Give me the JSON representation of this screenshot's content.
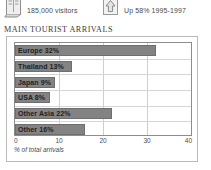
{
  "stats": [
    {
      "icon": "open-book-icon",
      "label": "185,000 visitors"
    },
    {
      "icon": "up-arrow-icon",
      "label": "Up 58% 1995-1997"
    }
  ],
  "title": "MAIN TOURIST ARRIVALS",
  "colors": {
    "bar_fill": "#838383",
    "bar_stroke": "#6e6e6e",
    "panel_border": "#b9b9b9",
    "plot_border": "#8c8c8c",
    "gridline": "#cfcfcf",
    "text": "#3a3a3a"
  },
  "chart_data": {
    "type": "bar",
    "orientation": "horizontal",
    "title": "MAIN TOURIST ARRIVALS",
    "xlabel": "% of total arrivals",
    "ylabel": "",
    "xlim": [
      0,
      40
    ],
    "xticks": [
      0,
      10,
      20,
      30,
      40
    ],
    "xtick_labels": [
      "0",
      "10",
      "20",
      "30",
      "40"
    ],
    "grid": true,
    "legend": false,
    "categories": [
      "Europe",
      "Thailand",
      "Japan",
      "USA",
      "Other Asia",
      "Other"
    ],
    "values": [
      32,
      13,
      9,
      8,
      22,
      16
    ],
    "bar_labels": [
      "Europe 32%",
      "Thailand 13%",
      "Japan 9%",
      "USA 8%",
      "Other Asia 22%",
      "Other 16%"
    ]
  }
}
